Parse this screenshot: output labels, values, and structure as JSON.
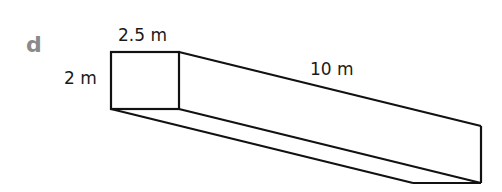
{
  "figure": {
    "part_label": "d",
    "shape": "cuboid",
    "dimensions": {
      "width": "2.5 m",
      "height": "2 m",
      "length": "10 m"
    },
    "colors": {
      "stroke": "#111111",
      "part_label": "#8a8a8a",
      "text": "#1a1a1a"
    }
  }
}
